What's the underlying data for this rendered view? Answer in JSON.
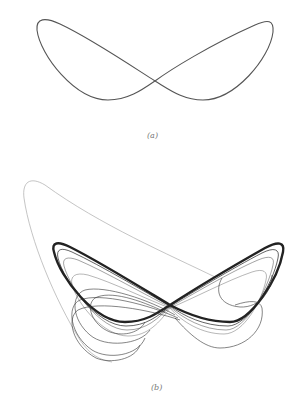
{
  "figure": {
    "panels": [
      {
        "id": "a",
        "label": "(a)",
        "description": "Single closed figure-eight periodic orbit (butterfly-shaped loop)",
        "stroke_color": "#555555"
      },
      {
        "id": "b",
        "label": "(b)",
        "description": "Chaotic attractor trajectory: dense figure-eight band with transient outer loop and inner spiral loops",
        "stroke_color": "#222222",
        "transient_color": "#999999"
      }
    ]
  }
}
